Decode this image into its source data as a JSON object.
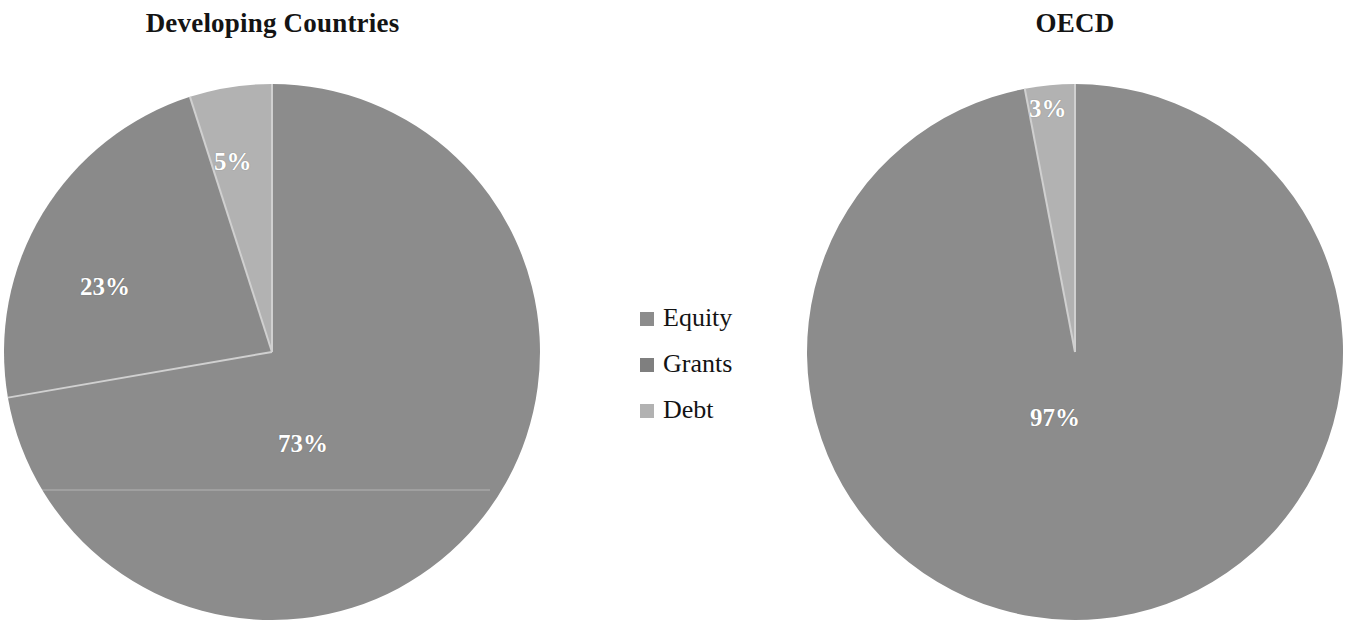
{
  "figure": {
    "background_color": "#ffffff"
  },
  "charts": [
    {
      "title": "Developing Countries",
      "labels": [
        "5%",
        "23%",
        "73%"
      ]
    },
    {
      "title": "OECD",
      "labels": [
        "3%",
        "97%"
      ]
    }
  ],
  "legend": {
    "items": [
      {
        "label": "Equity",
        "color": "#8c8c8c"
      },
      {
        "label": "Grants",
        "color": "#7f7f7f"
      },
      {
        "label": "Debt",
        "color": "#b2b2b2"
      }
    ]
  },
  "colors": {
    "equity": "#8c8c8c",
    "grants": "#8a8a8a",
    "debt": "#b2b2b2",
    "separator": "#d0d0d0",
    "label_text": "#ffffff",
    "title_text": "#141414"
  },
  "chart_data": [
    {
      "type": "pie",
      "title": "Developing Countries",
      "categories": [
        "Equity",
        "Grants",
        "Debt"
      ],
      "values": [
        73,
        23,
        5
      ],
      "value_labels": [
        "73%",
        "23%",
        "5%"
      ],
      "unit": "percent",
      "colors": [
        "#8c8c8c",
        "#8a8a8a",
        "#b2b2b2"
      ],
      "start_angle_deg": 0,
      "direction": "clockwise",
      "legend_position": "center-right-of-panel",
      "grid": false
    },
    {
      "type": "pie",
      "title": "OECD",
      "categories": [
        "Equity",
        "Debt"
      ],
      "values": [
        97,
        3
      ],
      "value_labels": [
        "97%",
        "3%"
      ],
      "unit": "percent",
      "colors": [
        "#8c8c8c",
        "#b2b2b2"
      ],
      "start_angle_deg": 0,
      "direction": "clockwise",
      "legend_position": "center-left-of-panel",
      "grid": false
    }
  ]
}
